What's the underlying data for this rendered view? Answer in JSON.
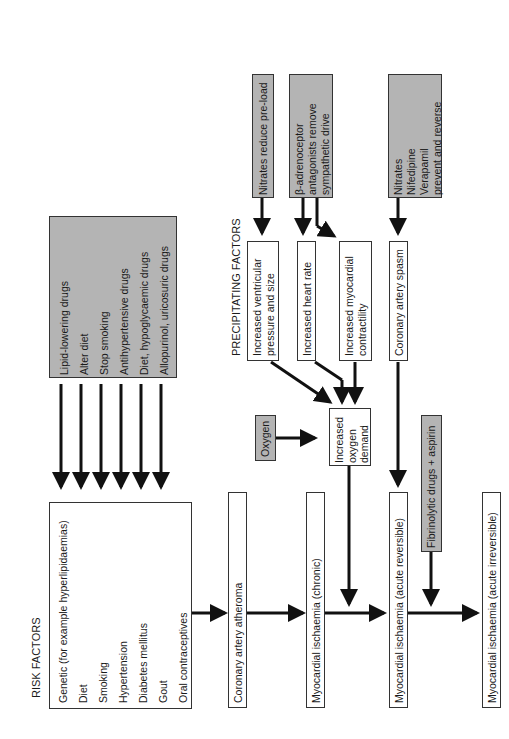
{
  "risk_factors": {
    "title": "RISK FACTORS",
    "items": [
      "Genetic (for example hyperlipidaemias)",
      "Diet",
      "Smoking",
      "Hypertension",
      "Diabetes mellitus",
      "Gout",
      "Oral contraceptives"
    ]
  },
  "risk_treatments": [
    "Lipid-lowering drugs",
    "Alter diet",
    "Stop smoking",
    "Antihypertensive drugs",
    "Diet, hypoglycaemic drugs",
    "Allopurinol, uricosuric drugs"
  ],
  "main_chain": [
    "Coronary artery atheroma",
    "Myocardial ischaemia (chronic)",
    "Myocardial ischaemia (acute reversible)",
    "Myocardial ischaemia (acute irreversible)"
  ],
  "precipitating": {
    "title": "PRECIPITATING FACTORS",
    "ventricular": [
      "Increased ventricular",
      "pressure and size"
    ],
    "heart_rate": "Increased heart rate",
    "contractility": [
      "Increased myocardial",
      "contractility"
    ],
    "spasm": "Coronary artery spasm"
  },
  "demand": [
    "Increased",
    "oxygen",
    "demand"
  ],
  "oxygen": "Oxygen",
  "fibrinolytic": "Fibrinolytic drugs + aspirin",
  "drugs": {
    "nitrates_preload": "Nitrates reduce pre-load",
    "beta": [
      "β-adrenoceptor",
      "antagonists remove",
      "sympathetic drive"
    ],
    "spasm_drugs": [
      "Nitrates",
      "Nifedipine",
      "Verapamil",
      "prevent and reverse"
    ]
  }
}
